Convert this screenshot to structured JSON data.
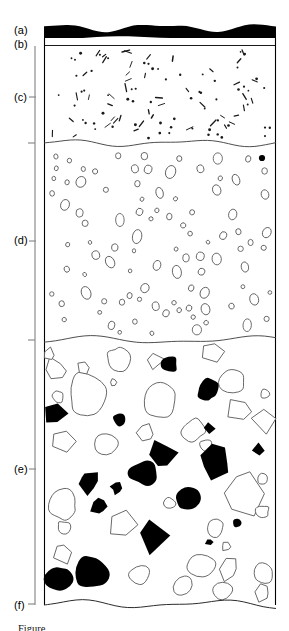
{
  "figure": {
    "type": "stratigraphic-column",
    "width": 289,
    "height": 631,
    "column": {
      "left": 44,
      "right": 276,
      "top": 24,
      "bottom": 604
    },
    "background_color": "#ffffff",
    "line_color": "#000000",
    "fill_dark": "#000000",
    "fill_light": "#ffffff",
    "clast_outline_color": "#585858",
    "pattern_color": "#1a1a1a"
  },
  "labels": [
    {
      "id": "a",
      "text": "(a)",
      "x": 14,
      "y": 25,
      "tick": false,
      "tick_y": 31
    },
    {
      "id": "b",
      "text": "(b)",
      "x": 14,
      "y": 39,
      "tick": false,
      "tick_y": 45
    },
    {
      "id": "c",
      "text": "(c)",
      "x": 14,
      "y": 92,
      "tick": true,
      "tick_y": 97
    },
    {
      "id": "d",
      "text": "(d)",
      "x": 14,
      "y": 235,
      "tick": true,
      "tick_y": 241
    },
    {
      "id": "e",
      "text": "(e)",
      "x": 14,
      "y": 464,
      "tick": true,
      "tick_y": 469
    },
    {
      "id": "f",
      "text": "(f)",
      "x": 14,
      "y": 600,
      "tick": false,
      "tick_y": 604
    }
  ],
  "bracket": {
    "x": 35,
    "top": 46,
    "bottom": 605,
    "color": "#8c8c8c",
    "nub_ys": [
      143,
      340,
      604
    ],
    "nub_width": 7
  },
  "units": [
    {
      "id": "a",
      "name": "organic-rich-cap",
      "description": "solid black wavy capping layer",
      "top": 24,
      "bottom": 38,
      "fill": "#000000",
      "pattern": "solid"
    },
    {
      "id": "b",
      "name": "thin-pale-band",
      "description": "thin white band below black cap",
      "top": 38,
      "bottom": 46,
      "fill": "#ffffff",
      "pattern": "blank"
    },
    {
      "id": "c",
      "name": "dot-and-dash-unit",
      "description": "fine matrix with scattered dots and short dashes",
      "top": 46,
      "bottom": 143,
      "fill": "#ffffff",
      "pattern": "dots-and-dashes"
    },
    {
      "id": "d",
      "name": "vesicular-oval-unit",
      "description": "matrix with scattered small open ovals / circles",
      "top": 143,
      "bottom": 340,
      "fill": "#ffffff",
      "pattern": "open-ovals"
    },
    {
      "id": "e",
      "name": "clast-rich-diamict-unit",
      "description": "matrix-supported coarse clasts, mixture of black and open outlined angular grains",
      "top": 340,
      "bottom": 604,
      "fill": "#ffffff",
      "pattern": "coarse-clasts"
    },
    {
      "id": "f",
      "name": "basal-contact",
      "description": "wavy basal contact of the logged section",
      "top": 604,
      "bottom": 604,
      "fill": "#ffffff",
      "pattern": "contact-line"
    }
  ],
  "caption": {
    "text": "Figure"
  }
}
